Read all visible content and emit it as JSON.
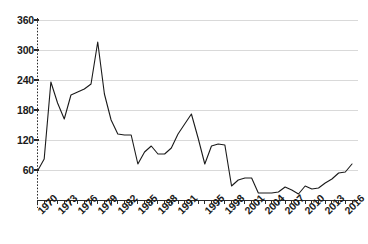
{
  "chart": {
    "title": "",
    "type": "line"
  },
  "chart_data": {
    "type": "line",
    "title": "",
    "subtitle": "",
    "xlabel": "",
    "ylabel": "",
    "xlim": [
      1970,
      2017
    ],
    "ylim": [
      0,
      375
    ],
    "yticks": [
      60,
      120,
      180,
      240,
      300,
      360
    ],
    "ytick_labels": [
      "60",
      "120",
      "180",
      "240",
      "300",
      "360"
    ],
    "xtick_labels": [
      "1970",
      "1973",
      "1976",
      "1979",
      "1982",
      "1985",
      "1988",
      "1991",
      "1995",
      "1998",
      "2001",
      "2004",
      "2007",
      "2010",
      "2013",
      "2016"
    ],
    "xtick_years": [
      1970,
      1973,
      1976,
      1979,
      1982,
      1985,
      1988,
      1991,
      1995,
      1998,
      2001,
      2004,
      2007,
      2010,
      2013,
      2016
    ],
    "grid": "horizontal",
    "legend": "none",
    "line_color": "#1a1a1a",
    "grid_color": "#d9d9d9",
    "x": [
      1970,
      1971,
      1972,
      1973,
      1974,
      1975,
      1976,
      1977,
      1978,
      1979,
      1980,
      1981,
      1982,
      1983,
      1984,
      1985,
      1986,
      1987,
      1988,
      1989,
      1990,
      1991,
      1992,
      1993,
      1994,
      1995,
      1996,
      1997,
      1998,
      1999,
      2000,
      2001,
      2002,
      2003,
      2004,
      2005,
      2006,
      2007,
      2008,
      2009,
      2010,
      2011,
      2012,
      2013,
      2014,
      2015,
      2016,
      2017
    ],
    "values": [
      58,
      82,
      236,
      194,
      162,
      210,
      216,
      222,
      232,
      316,
      212,
      160,
      132,
      130,
      130,
      72,
      96,
      108,
      92,
      92,
      104,
      132,
      152,
      172,
      124,
      72,
      108,
      112,
      110,
      28,
      40,
      44,
      44,
      14,
      14,
      14,
      16,
      26,
      20,
      12,
      28,
      22,
      24,
      34,
      42,
      54,
      56,
      72
    ],
    "series": [
      {
        "name": "series-1",
        "values": [
          58,
          82,
          236,
          194,
          162,
          210,
          216,
          222,
          232,
          316,
          212,
          160,
          132,
          130,
          130,
          72,
          96,
          108,
          92,
          92,
          104,
          132,
          152,
          172,
          124,
          72,
          108,
          112,
          110,
          28,
          40,
          44,
          44,
          14,
          14,
          14,
          16,
          26,
          20,
          12,
          28,
          22,
          24,
          34,
          42,
          54,
          56,
          72
        ]
      }
    ]
  }
}
